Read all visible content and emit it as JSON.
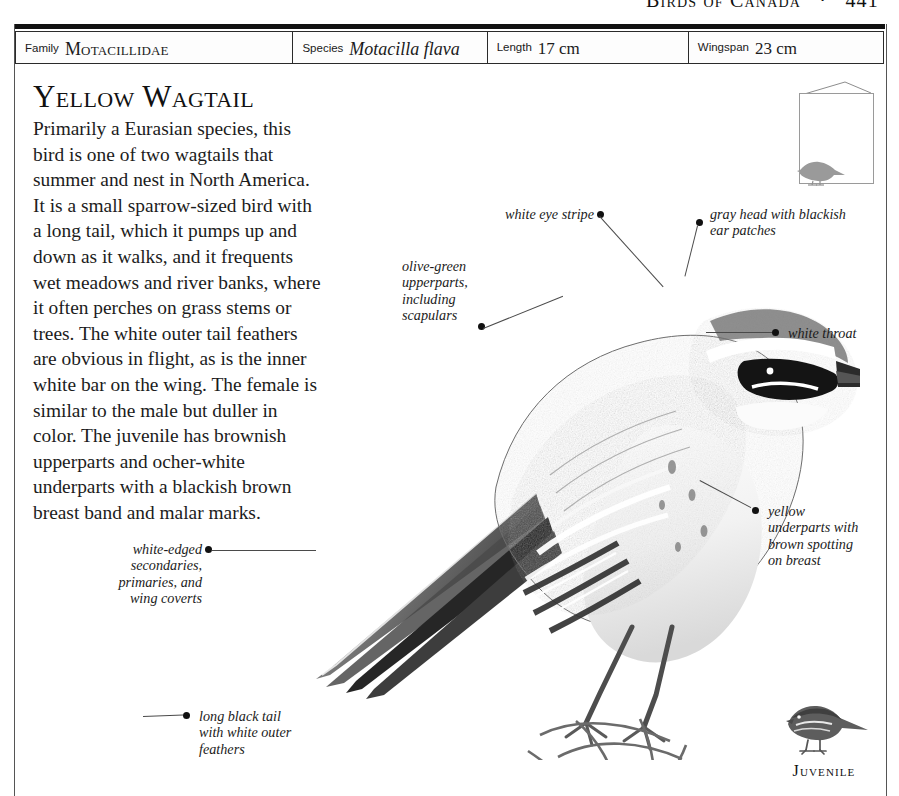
{
  "running_head": {
    "title": "Birds of Canada",
    "separator": "·",
    "page_number": "441"
  },
  "data_strip": [
    {
      "key": "Family",
      "value": "Motacillidae",
      "style": "small-caps"
    },
    {
      "key": "Species",
      "value": "Motacilla flava",
      "style": "italic"
    },
    {
      "key": "Length",
      "value": "17 cm",
      "style": "plain"
    },
    {
      "key": "Wingspan",
      "value": "23 cm",
      "style": "plain"
    }
  ],
  "species_account": {
    "headline": "Yellow Wagtail",
    "body": "Primarily a Eurasian species, this bird is one of two wagtails that summer and nest in North America. It is a small sparrow-sized bird with a long tail, which it pumps up and down as it walks, and it frequents wet meadows and river banks, where it often perches on grass stems or trees. The white outer tail feathers are obvious in flight, as is the inner white bar on the wing. The female is similar to the male but duller in color. The juvenile has brownish upperparts and ocher-white underparts with a blackish brown breast band and malar marks."
  },
  "annotations": [
    {
      "id": "white-eye-stripe",
      "text": "white eye stripe"
    },
    {
      "id": "gray-head",
      "text": "gray head with blackish\near patches"
    },
    {
      "id": "olive-green-upperparts",
      "text": "olive-green\nupperparts,\nincluding\nscapulars"
    },
    {
      "id": "white-throat",
      "text": "white throat"
    },
    {
      "id": "yellow-underparts",
      "text": "yellow\nunderparts with\nbrown spotting\non breast"
    },
    {
      "id": "white-edged-feathers",
      "text": "white-edged\nsecondaries,\nprimaries, and\nwing coverts"
    },
    {
      "id": "long-black-tail",
      "text": "long black tail\nwith white outer\nfeathers"
    }
  ],
  "figures": {
    "size_comparison": {
      "caption": ""
    },
    "juvenile": {
      "caption": "Juvenile"
    },
    "main_plate": {
      "caption": ""
    }
  },
  "colors": {
    "ink": "#1a1a1a",
    "rule": "#111111",
    "border": "#555555",
    "leader": "#4a4a4a"
  }
}
